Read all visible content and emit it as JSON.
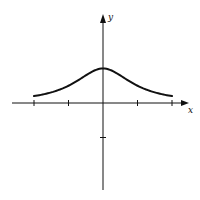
{
  "chart_data": {
    "type": "line",
    "title": "",
    "xlabel": "x",
    "ylabel": "y",
    "function": "y = 1/(1+x^2)",
    "xlim": [
      -2.6,
      2.5
    ],
    "ylim": [
      -2.5,
      2.5
    ],
    "x_ticks": [
      -2,
      -1,
      0,
      1,
      2
    ],
    "y_ticks": [
      -1
    ],
    "grid": false,
    "legend": null,
    "series": [
      {
        "name": "curve",
        "x": [
          -2,
          -1.5,
          -1,
          -0.5,
          0,
          0.5,
          1,
          1.5,
          2
        ],
        "values": [
          0.2,
          0.31,
          0.5,
          0.8,
          1.0,
          0.8,
          0.5,
          0.31,
          0.2
        ]
      }
    ]
  },
  "labels": {
    "x_axis": "x",
    "y_axis": "y"
  },
  "colors": {
    "ink": "#111111",
    "background": "#ffffff"
  }
}
